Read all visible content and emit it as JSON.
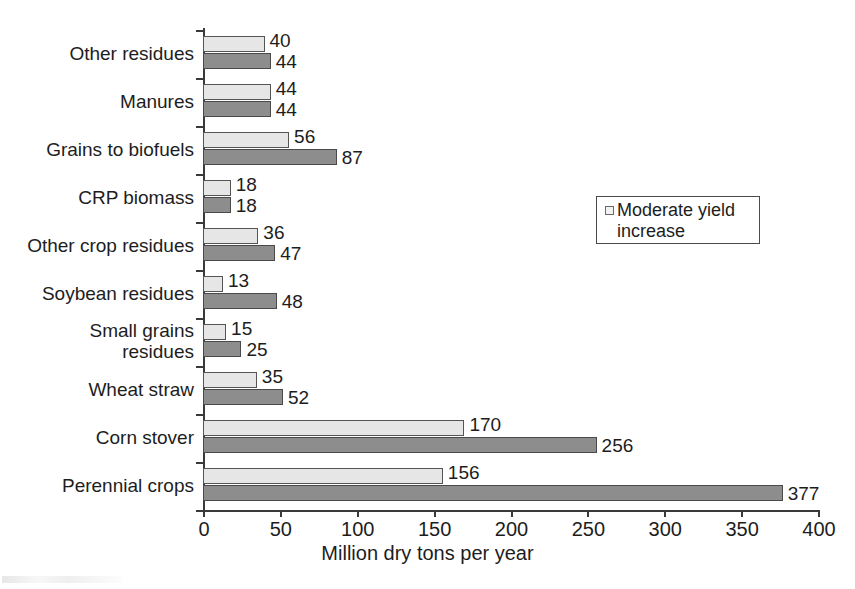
{
  "chart_data": {
    "type": "bar",
    "orientation": "horizontal",
    "title": "",
    "xlabel": "Million dry tons per year",
    "ylabel": "",
    "xlim": [
      0,
      400
    ],
    "xticks": [
      0,
      50,
      100,
      150,
      200,
      250,
      300,
      350,
      400
    ],
    "xtick_labels": [
      "0",
      "50",
      "100",
      "150",
      "200",
      "250",
      "300",
      "350",
      "400"
    ],
    "grid": false,
    "legend_position": "center-right",
    "legend_entries": [
      "Moderate yield increase"
    ],
    "categories": [
      "Other residues",
      "Manures",
      "Grains to biofuels",
      "CRP biomass",
      "Other crop residues",
      "Soybean residues",
      "Small grains\nresidues",
      "Wheat straw",
      "Corn stover",
      "Perennial crops"
    ],
    "series": [
      {
        "name": "Baseline",
        "style": "light",
        "color": "#e6e6e6",
        "values": [
          40,
          44,
          56,
          18,
          36,
          13,
          15,
          35,
          170,
          156
        ]
      },
      {
        "name": "Moderate yield increase",
        "style": "dark",
        "color": "#8d8d8d",
        "values": [
          44,
          44,
          87,
          18,
          47,
          48,
          25,
          52,
          256,
          377
        ]
      }
    ]
  },
  "legend": {
    "label": "Moderate yield increase",
    "swatch_color": "#f2f2f2"
  },
  "axis": {
    "x_title": "Million dry tons per year"
  }
}
